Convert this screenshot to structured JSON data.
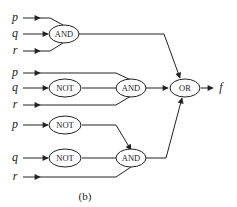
{
  "diagram": {
    "type": "logic-circuit",
    "caption": "(b)",
    "output_label": "f",
    "inputs": {
      "g1": [
        "p",
        "q",
        "r"
      ],
      "g2": [
        "p",
        "q",
        "r"
      ],
      "g3": [
        "p",
        "q",
        "r"
      ]
    },
    "gates": {
      "and1": "AND",
      "not1": "NOT",
      "and2": "AND",
      "or1": "OR",
      "not2": "NOT",
      "not3": "NOT",
      "and3": "AND"
    }
  }
}
